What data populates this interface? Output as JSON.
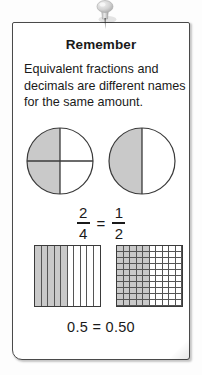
{
  "card": {
    "title": "Remember",
    "body_lines": [
      "Equivalent fractions and",
      "decimals are different names",
      "for the same amount."
    ]
  },
  "pushpin": {
    "icon": "pushpin-icon",
    "color": "#d0d0d0"
  },
  "models": {
    "shade_color": "#c9c9c9",
    "line_color": "#3a3a3a",
    "circles": [
      {
        "name": "two-fourths-circle",
        "label": "2/4",
        "total_parts": 4,
        "shaded_parts": 2,
        "divisions": [
          "vertical",
          "horizontal"
        ],
        "shaded_regions": [
          "top-left",
          "bottom-left"
        ]
      },
      {
        "name": "one-half-circle",
        "label": "1/2",
        "total_parts": 2,
        "shaded_parts": 1,
        "divisions": [
          "vertical"
        ],
        "shaded_regions": [
          "left"
        ]
      }
    ],
    "grids": [
      {
        "name": "tenths-grid",
        "columns": 10,
        "rows": 1,
        "total_cells": 10,
        "shaded_cells": 5,
        "value": "0.5"
      },
      {
        "name": "hundredths-grid",
        "columns": 10,
        "rows": 10,
        "total_cells": 100,
        "shaded_cells": 50,
        "value": "0.50"
      }
    ]
  },
  "fraction_equation": {
    "left": {
      "numerator": "2",
      "denominator": "4"
    },
    "operator": "=",
    "right": {
      "numerator": "1",
      "denominator": "2"
    }
  },
  "decimal_equation": "0.5 = 0.50"
}
